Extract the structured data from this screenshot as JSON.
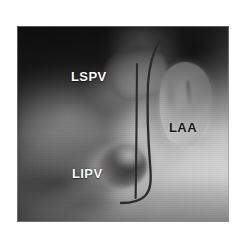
{
  "figure": {
    "modality": "3D CT endoscopic view",
    "background_color": "#ffffff",
    "panel": {
      "x": 17,
      "y": 26,
      "width": 212,
      "height": 196,
      "border_color": "#8c8c8c"
    }
  },
  "annotations": {
    "labels": [
      {
        "id": "lspv",
        "text": "LSPV",
        "meaning": "left superior pulmonary vein",
        "style": "light",
        "color": "#fbfbfb",
        "x": 54,
        "y": 44
      },
      {
        "id": "lipv",
        "text": "LIPV",
        "meaning": "left inferior pulmonary vein",
        "style": "light",
        "color": "#fbfbfb",
        "x": 55,
        "y": 141
      },
      {
        "id": "laa",
        "text": "LAA",
        "meaning": "left atrial appendage",
        "style": "dark",
        "color": "#171717",
        "x": 152,
        "y": 95
      }
    ],
    "overlay_lines": [
      {
        "id": "ablation-line-straight",
        "description": "straight dark vertical catheter / ablation line",
        "color": "#2b2b2b",
        "stroke_width": 2.1,
        "path": "M 120 38 L 119.5 100 L 119 148 L 118.6 172"
      },
      {
        "id": "ablation-line-curved",
        "description": "curved dark line arcing at top and hooking left at the bottom",
        "color": "#2b2b2b",
        "stroke_width": 2.3,
        "path": "M 143 14 C 136 26, 132 40, 131 58 C 130 84, 131 112, 133 138 C 134.5 154, 134 164, 128 170 C 122 176, 112 177, 104 177"
      }
    ]
  },
  "anatomy": {
    "structures": [
      {
        "id": "lspv-ostium",
        "name": "LSPV ostium",
        "brightness": "bright"
      },
      {
        "id": "lipv-ostium",
        "name": "LIPV ostium",
        "brightness": "dark-funnel"
      },
      {
        "id": "laa-body",
        "name": "LAA lobe",
        "brightness": "bright"
      },
      {
        "id": "tissue-mass-left",
        "name": "left atrial wall / myocardium",
        "brightness": "mid-grey"
      }
    ]
  },
  "palette": {
    "page_background": "#ffffff",
    "image_dark": "#1d1d1d",
    "image_mid": "#8a8a8a",
    "image_light": "#f6f6f6",
    "line_color": "#2b2b2b",
    "label_light": "#fbfbfb",
    "label_dark": "#171717"
  }
}
